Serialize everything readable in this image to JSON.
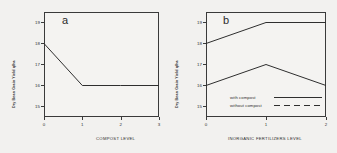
{
  "figure": {
    "background_color": "#f2f1ef",
    "line_color": "#2e2e2e"
  },
  "chart_data": [
    {
      "type": "line",
      "panel_label": "a",
      "title": "",
      "xlabel": "COMPOST LEVEL",
      "ylabel": "Dry Bean Grain Yield q/ha",
      "x": [
        0,
        1,
        2,
        3
      ],
      "xticklabels": [
        "0",
        "1",
        "2",
        "3"
      ],
      "yticklabels": [
        "19",
        "18",
        "17",
        "16",
        "15"
      ],
      "ylim": [
        14.5,
        19.5
      ],
      "xlim": [
        0,
        3
      ],
      "grid": false,
      "legend": null,
      "series": [
        {
          "name": "yield",
          "style": "solid",
          "values": [
            18,
            16,
            16,
            16
          ]
        }
      ]
    },
    {
      "type": "line",
      "panel_label": "b",
      "title": "",
      "xlabel": "INORGANIC FERTILIZERS LEVEL",
      "ylabel": "Dry Bean Grain Yield q/ha",
      "x": [
        0,
        1,
        2
      ],
      "xticklabels": [
        "0",
        "1",
        "2"
      ],
      "yticklabels": [
        "19",
        "18",
        "17",
        "16",
        "15"
      ],
      "ylim": [
        14.5,
        19.5
      ],
      "xlim": [
        0,
        2
      ],
      "grid": false,
      "legend_position": "lower-center",
      "series": [
        {
          "name": "with compost",
          "style": "solid",
          "values": [
            18,
            19,
            19
          ]
        },
        {
          "name": "without compost",
          "style": "dashed",
          "values": [
            16,
            17,
            16
          ]
        }
      ]
    }
  ]
}
